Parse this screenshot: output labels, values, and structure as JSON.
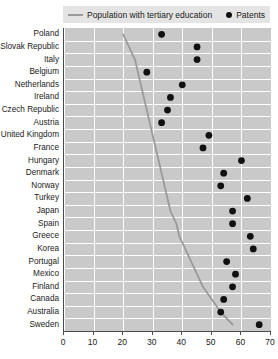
{
  "chart_data": {
    "type": "scatter",
    "title": "",
    "xlabel": "",
    "ylabel": "",
    "xlim": [
      0,
      70
    ],
    "xticks": [
      0,
      10,
      20,
      30,
      40,
      50,
      60,
      70
    ],
    "grid": true,
    "legend_position": "top",
    "orientation": "horizontal",
    "categories": [
      "Poland",
      "Slovak Republic",
      "Italy",
      "Belgium",
      "Netherlands",
      "Ireland",
      "Czech Republic",
      "Austria",
      "United Kingdom",
      "France",
      "Hungary",
      "Denmark",
      "Norway",
      "Turkey",
      "Japan",
      "Spain",
      "Greece",
      "Korea",
      "Portugal",
      "Mexico",
      "Finland",
      "Canada",
      "Australia",
      "Sweden"
    ],
    "series": [
      {
        "name": "Population with tertiary education",
        "type": "line",
        "color": "#9a9a9a",
        "values": [
          20,
          22,
          24,
          25,
          26,
          27,
          28,
          29,
          30,
          31,
          32,
          33,
          34,
          35,
          36,
          38,
          39,
          41,
          43,
          45,
          47,
          50,
          53,
          57
        ]
      },
      {
        "name": "Patents",
        "type": "scatter",
        "color": "#111111",
        "values": [
          33,
          45,
          45,
          28,
          40,
          36,
          35,
          33,
          49,
          47,
          60,
          54,
          53,
          62,
          57,
          57,
          63,
          64,
          55,
          58,
          57,
          54,
          53,
          66
        ]
      }
    ]
  },
  "legend": {
    "entries": [
      {
        "label": "Population with tertiary education",
        "marker": "line-swatch"
      },
      {
        "label": "Patents",
        "marker": "dot-swatch"
      }
    ]
  }
}
